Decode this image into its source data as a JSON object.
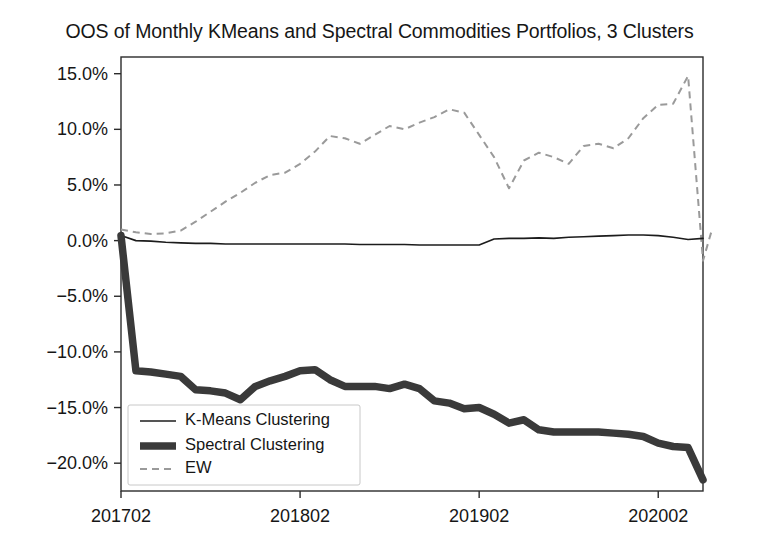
{
  "chart_data": {
    "type": "line",
    "title": "OOS of Monthly KMeans and Spectral Commodities Portfolios, 3 Clusters",
    "xlabel": "",
    "ylabel": "",
    "grid": false,
    "legend_position": "lower left",
    "ylim": [
      -22.5,
      16.5
    ],
    "ytick_labels": [
      "15.0%",
      "10.0%",
      "5.0%",
      "0.0%",
      "−5.0%",
      "−10.0%",
      "−15.0%",
      "−20.0%"
    ],
    "ytick_values": [
      15.0,
      10.0,
      5.0,
      0.0,
      -5.0,
      -10.0,
      -15.0,
      -20.0
    ],
    "xtick_labels": [
      "201702",
      "201802",
      "201902",
      "202002"
    ],
    "xtick_values": [
      0,
      12,
      24,
      36
    ],
    "x": [
      0,
      1,
      2,
      3,
      4,
      5,
      6,
      7,
      8,
      9,
      10,
      11,
      12,
      13,
      14,
      15,
      16,
      17,
      18,
      19,
      20,
      21,
      22,
      23,
      24,
      25,
      26,
      27,
      28,
      29,
      30,
      31,
      32,
      33,
      34,
      35,
      36,
      37,
      38,
      39
    ],
    "series": [
      {
        "name": "K-Means Clustering",
        "style": "solid-thin",
        "color": "#1c1c1c",
        "values": [
          0.45,
          0.0,
          -0.05,
          -0.15,
          -0.2,
          -0.25,
          -0.25,
          -0.3,
          -0.3,
          -0.3,
          -0.3,
          -0.3,
          -0.3,
          -0.3,
          -0.3,
          -0.3,
          -0.35,
          -0.35,
          -0.35,
          -0.35,
          -0.4,
          -0.4,
          -0.4,
          -0.4,
          -0.4,
          0.15,
          0.2,
          0.2,
          0.25,
          0.2,
          0.3,
          0.35,
          0.4,
          0.45,
          0.5,
          0.5,
          0.45,
          0.3,
          0.1,
          0.2
        ]
      },
      {
        "name": "Spectral Clustering",
        "style": "solid-thick",
        "color": "#3a3a3a",
        "values": [
          0.45,
          -11.7,
          -11.8,
          -12.0,
          -12.2,
          -13.4,
          -13.5,
          -13.7,
          -14.3,
          -13.1,
          -12.6,
          -12.2,
          -11.7,
          -11.6,
          -12.5,
          -13.1,
          -13.1,
          -13.1,
          -13.3,
          -12.9,
          -13.3,
          -14.4,
          -14.6,
          -15.1,
          -15.0,
          -15.6,
          -16.4,
          -16.1,
          -17.0,
          -17.2,
          -17.2,
          -17.2,
          -17.2,
          -17.3,
          -17.4,
          -17.6,
          -18.2,
          -18.5,
          -18.6,
          -21.5
        ]
      },
      {
        "name": "EW",
        "style": "dashed",
        "color": "#9a9a9a",
        "values": [
          1.0,
          0.75,
          0.6,
          0.65,
          0.9,
          1.7,
          2.6,
          3.5,
          4.3,
          5.2,
          5.9,
          6.1,
          6.9,
          8.0,
          9.4,
          9.2,
          8.7,
          9.5,
          10.3,
          10.0,
          10.6,
          11.1,
          11.8,
          11.5,
          9.5,
          7.5,
          4.7,
          7.2,
          7.9,
          7.5,
          6.9,
          8.5,
          8.7,
          8.3,
          9.2,
          11.0,
          12.2,
          12.3,
          14.8,
          -1.8
        ]
      }
    ],
    "final_ew_recovery": 1.0
  },
  "legend": {
    "entries": [
      {
        "label": "K-Means Clustering",
        "marker": "line-thin-solid"
      },
      {
        "label": "Spectral Clustering",
        "marker": "line-thick-solid"
      },
      {
        "label": "EW",
        "marker": "line-dashed"
      }
    ]
  }
}
